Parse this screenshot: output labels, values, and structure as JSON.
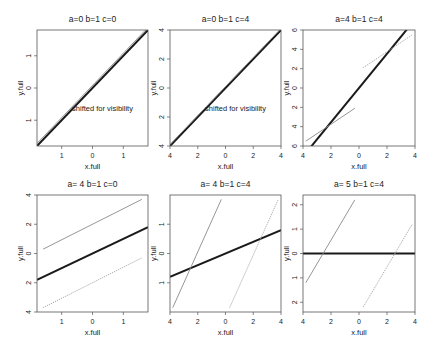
{
  "chart_data": [
    {
      "type": "line",
      "title": "a=0 b=1 c=0",
      "xlabel": "x.full",
      "ylabel": "y.full",
      "xticks": [
        "1",
        "0",
        "1"
      ],
      "yticks": [
        "1",
        "0",
        "1"
      ],
      "annotation": "shifted for visibility",
      "box": [
        37,
        30,
        148,
        146
      ],
      "xlim": [
        -1.8,
        1.8
      ],
      "ylim": [
        -1.8,
        1.8
      ],
      "xtick_vals": [
        -1,
        0,
        1
      ],
      "ytick_vals": [
        -1,
        0,
        1
      ],
      "series": [
        {
          "name": "fit",
          "style": "thick",
          "x": [
            -1.8,
            1.8
          ],
          "y": [
            -1.8,
            1.8
          ]
        },
        {
          "name": "shifted",
          "style": "thin-gray",
          "x": [
            -1.8,
            1.8
          ],
          "y": [
            -1.72,
            1.88
          ]
        }
      ]
    },
    {
      "type": "line",
      "title": "a=0 b=1 c=4",
      "xlabel": "x.full",
      "ylabel": "y.full",
      "xticks": [
        "4",
        "2",
        "0",
        "2",
        "4"
      ],
      "yticks": [
        "4",
        "2",
        "0",
        "2",
        "4"
      ],
      "annotation": "shifted for visibility",
      "box": [
        170,
        30,
        281,
        146
      ],
      "xlim": [
        -4,
        4
      ],
      "ylim": [
        -4,
        4
      ],
      "xtick_vals": [
        -4,
        -2,
        0,
        2,
        4
      ],
      "ytick_vals": [
        -4,
        -2,
        0,
        2,
        4
      ],
      "series": [
        {
          "name": "fit",
          "style": "thick",
          "x": [
            -4,
            4
          ],
          "y": [
            -4,
            4
          ]
        },
        {
          "name": "shifted",
          "style": "thin-gray",
          "x": [
            -4,
            4
          ],
          "y": [
            -3.9,
            4.1
          ]
        }
      ]
    },
    {
      "type": "line",
      "title": "a=4 b=1 c=4",
      "xlabel": "x.full",
      "ylabel": "y.full",
      "xticks": [
        "4",
        "2",
        "0",
        "2",
        "4"
      ],
      "yticks": [
        "6",
        "4",
        "2",
        "0",
        "2",
        "4",
        "6"
      ],
      "box": [
        303,
        30,
        415,
        146
      ],
      "xlim": [
        -4,
        4
      ],
      "ylim": [
        -6,
        6
      ],
      "xtick_vals": [
        -4,
        -2,
        0,
        2,
        4
      ],
      "ytick_vals": [
        -6,
        -4,
        -2,
        0,
        2,
        4,
        6
      ],
      "series": [
        {
          "name": "fit",
          "style": "thick",
          "x": [
            -3.5,
            3.5
          ],
          "y": [
            -6.2,
            6.2
          ]
        },
        {
          "name": "lower",
          "style": "thin-gray",
          "x": [
            -3.8,
            -0.3
          ],
          "y": [
            -5.5,
            -2.1
          ]
        },
        {
          "name": "upper",
          "style": "dotted-gray",
          "x": [
            0.3,
            3.8
          ],
          "y": [
            2.1,
            5.5
          ]
        }
      ]
    },
    {
      "type": "line",
      "title": "a= 4 b=1 c=0",
      "xlabel": "x.full",
      "ylabel": "y.full",
      "xticks": [
        "1",
        "0",
        "1"
      ],
      "yticks": [
        "4",
        "2",
        "0",
        "2",
        "4"
      ],
      "box": [
        37,
        195,
        148,
        312
      ],
      "xlim": [
        -1.8,
        1.8
      ],
      "ylim": [
        -4,
        4
      ],
      "xtick_vals": [
        -1,
        0,
        1
      ],
      "ytick_vals": [
        -4,
        -2,
        0,
        2,
        4
      ],
      "series": [
        {
          "name": "fit",
          "style": "thick",
          "x": [
            -1.8,
            1.8
          ],
          "y": [
            -1.8,
            1.8
          ]
        },
        {
          "name": "upper",
          "style": "thin-gray",
          "x": [
            -1.6,
            1.6
          ],
          "y": [
            0.3,
            3.7
          ]
        },
        {
          "name": "lower",
          "style": "dotted-gray",
          "x": [
            -1.6,
            1.6
          ],
          "y": [
            -3.7,
            -0.3
          ]
        }
      ]
    },
    {
      "type": "line",
      "title": "a= 4 b=1 c=4",
      "xlabel": "x.full",
      "ylabel": "y.full",
      "xticks": [
        "4",
        "2",
        "0",
        "2",
        "4"
      ],
      "yticks": [
        "1",
        "0",
        "1"
      ],
      "box": [
        170,
        195,
        281,
        312
      ],
      "xlim": [
        -4,
        4
      ],
      "ylim": [
        -2,
        2
      ],
      "xtick_vals": [
        -4,
        -2,
        0,
        2,
        4
      ],
      "ytick_vals": [
        -1,
        0,
        1
      ],
      "series": [
        {
          "name": "fit",
          "style": "thick",
          "x": [
            -4,
            4
          ],
          "y": [
            -0.8,
            0.8
          ]
        },
        {
          "name": "left",
          "style": "thin-gray",
          "x": [
            -3.8,
            -0.3
          ],
          "y": [
            -1.85,
            1.85
          ]
        },
        {
          "name": "right",
          "style": "dotted-gray",
          "x": [
            0.3,
            3.8
          ],
          "y": [
            -1.85,
            1.85
          ]
        }
      ]
    },
    {
      "type": "line",
      "title": "a= 5 b=1 c=4",
      "xlabel": "x.full",
      "ylabel": "y.full",
      "xticks": [
        "4",
        "2",
        "0",
        "2",
        "4"
      ],
      "yticks": [
        "2",
        "1",
        "0",
        "1",
        "2"
      ],
      "box": [
        303,
        195,
        415,
        312
      ],
      "xlim": [
        -4,
        4
      ],
      "ylim": [
        -2.4,
        2.4
      ],
      "xtick_vals": [
        -4,
        -2,
        0,
        2,
        4
      ],
      "ytick_vals": [
        -2,
        -1,
        0,
        1,
        2
      ],
      "series": [
        {
          "name": "fit",
          "style": "thick",
          "x": [
            -4,
            4
          ],
          "y": [
            0,
            0
          ]
        },
        {
          "name": "left",
          "style": "thin-gray",
          "x": [
            -3.8,
            -0.3
          ],
          "y": [
            -1.2,
            2.2
          ]
        },
        {
          "name": "right",
          "style": "dotted-gray",
          "x": [
            0.3,
            3.8
          ],
          "y": [
            -2.2,
            1.2
          ]
        }
      ]
    }
  ]
}
